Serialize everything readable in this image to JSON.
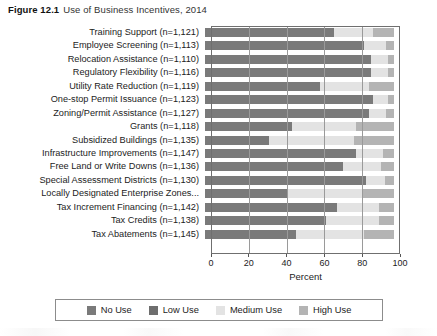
{
  "figure": {
    "number": "Figure 12.1",
    "title": "Use of Business Incentives, 2014"
  },
  "colors": {
    "no_use": "#7a7a7a",
    "low_use": "#6e6e6e",
    "medium_use": "#e3e3e3",
    "high_use": "#b4b4b4",
    "frame": "#6f6f6f",
    "gridline": "#9a9a9a",
    "text": "#1c1c1c"
  },
  "legend": {
    "position": "bottom",
    "items": [
      {
        "label": "No Use",
        "color": "#7a7a7a"
      },
      {
        "label": "Low Use",
        "color": "#6e6e6e"
      },
      {
        "label": "Medium Use",
        "color": "#e3e3e3"
      },
      {
        "label": "High Use",
        "color": "#b4b4b4"
      }
    ]
  },
  "chart_data": {
    "type": "bar",
    "orientation": "horizontal",
    "stacked": true,
    "stack_normalized": true,
    "title": "Use of Business Incentives, 2014",
    "xlabel": "Percent",
    "ylabel": "",
    "xlim": [
      0,
      100
    ],
    "xticks": [
      0,
      20,
      40,
      60,
      80,
      100
    ],
    "grid": true,
    "grid_axis": "x",
    "categories": [
      "Training Support (n=1,121)",
      "Employee Screening (n=1,113)",
      "Relocation Assistance (n=1,110)",
      "Regulatory Flexibility (n=1,116)",
      "Utility Rate Reduction (n=1,119)",
      "One-stop Permit Issuance (n=1,123)",
      "Zoning/Permit Assistance (n=1,127)",
      "Grants (n=1,118)",
      "Subsidized Buildings (n=1,135)",
      "Infrastructure Improvements (n=1,147)",
      "Free Land or Write Downs (n=1,136)",
      "Special Assessment Districts (n=1,130)",
      "Locally Designated Enterprise Zones...",
      "Tax Increment Financing (n=1,142)",
      "Tax Credits (n=1,138)",
      "Tax Abatements (n=1,145)"
    ],
    "series": [
      {
        "name": "No Use",
        "color": "#7a7a7a",
        "values": [
          68,
          84,
          88,
          88,
          61,
          89,
          87,
          46,
          34,
          80,
          73,
          85,
          44,
          70,
          64,
          48
        ]
      },
      {
        "name": "Low Use",
        "color": "#6e6e6e",
        "values": [
          0,
          0,
          0,
          0,
          0,
          0,
          0,
          0,
          0,
          0,
          0,
          0,
          0,
          0,
          0,
          0
        ]
      },
      {
        "name": "Medium Use",
        "color": "#e3e3e3",
        "values": [
          21,
          12,
          9,
          9,
          26,
          8,
          9,
          34,
          45,
          14,
          20,
          10,
          39,
          22,
          28,
          36
        ]
      },
      {
        "name": "High Use",
        "color": "#b4b4b4",
        "values": [
          11,
          4,
          3,
          3,
          13,
          3,
          4,
          20,
          21,
          6,
          7,
          5,
          17,
          8,
          8,
          16
        ]
      }
    ]
  }
}
